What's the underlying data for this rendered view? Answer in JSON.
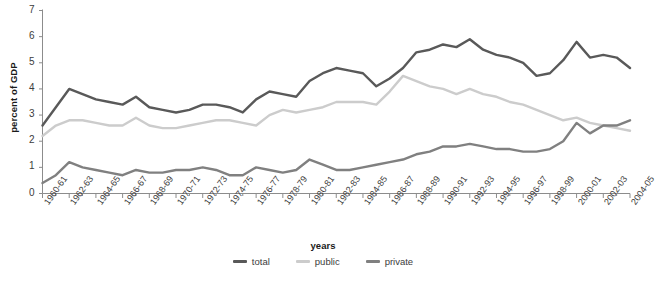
{
  "chart_data": {
    "type": "line",
    "title": "",
    "xlabel": "years",
    "ylabel": "percent of GDP",
    "ylim": [
      0,
      7
    ],
    "yticks": [
      0,
      1,
      2,
      3,
      4,
      5,
      6,
      7
    ],
    "grid": false,
    "legend_position": "bottom-center",
    "categories": [
      "1960-61",
      "1961-62",
      "1962-63",
      "1963-64",
      "1964-65",
      "1965-66",
      "1966-67",
      "1967-68",
      "1968-69",
      "1969-70",
      "1970-71",
      "1971-72",
      "1972-73",
      "1973-74",
      "1974-75",
      "1975-76",
      "1976-77",
      "1977-78",
      "1978-79",
      "1979-80",
      "1980-81",
      "1981-82",
      "1982-83",
      "1983-84",
      "1984-85",
      "1985-86",
      "1986-87",
      "1987-88",
      "1988-89",
      "1989-90",
      "1990-91",
      "1991-92",
      "1992-93",
      "1993-94",
      "1994-95",
      "1995-96",
      "1996-97",
      "1997-98",
      "1998-99",
      "1999-00",
      "2000-01",
      "2001-02",
      "2002-03",
      "2003-04",
      "2004-05"
    ],
    "tick_labels": [
      "1960-61",
      "1962-63",
      "1964-65",
      "1966-67",
      "1968-69",
      "1970-71",
      "1972-73",
      "1974-75",
      "1976-77",
      "1978-79",
      "1980-81",
      "1982-83",
      "1984-85",
      "1986-87",
      "1988-89",
      "1990-91",
      "1992-93",
      "1994-95",
      "1996-97",
      "1998-99",
      "2000-01",
      "2002-03",
      "2004-05"
    ],
    "series": [
      {
        "name": "total",
        "color": "#595959",
        "values": [
          2.6,
          3.3,
          4.0,
          3.8,
          3.6,
          3.5,
          3.4,
          3.7,
          3.3,
          3.2,
          3.1,
          3.2,
          3.4,
          3.4,
          3.3,
          3.1,
          3.6,
          3.9,
          3.8,
          3.7,
          4.3,
          4.6,
          4.8,
          4.7,
          4.6,
          4.1,
          4.4,
          4.8,
          5.4,
          5.5,
          5.7,
          5.6,
          5.9,
          5.5,
          5.3,
          5.2,
          5.0,
          4.5,
          4.6,
          5.1,
          5.8,
          5.2,
          5.3,
          5.2,
          4.8
        ]
      },
      {
        "name": "public",
        "color": "#cccccc",
        "values": [
          2.2,
          2.6,
          2.8,
          2.8,
          2.7,
          2.6,
          2.6,
          2.9,
          2.6,
          2.5,
          2.5,
          2.6,
          2.7,
          2.8,
          2.8,
          2.7,
          2.6,
          3.0,
          3.2,
          3.1,
          3.2,
          3.3,
          3.5,
          3.5,
          3.5,
          3.4,
          3.9,
          4.5,
          4.3,
          4.1,
          4.0,
          3.8,
          4.0,
          3.8,
          3.7,
          3.5,
          3.4,
          3.2,
          3.0,
          2.8,
          2.9,
          2.7,
          2.6,
          2.5,
          2.4
        ]
      },
      {
        "name": "private",
        "color": "#808080",
        "values": [
          0.4,
          0.7,
          1.2,
          1.0,
          0.9,
          0.8,
          0.7,
          0.9,
          0.8,
          0.8,
          0.9,
          0.9,
          1.0,
          0.9,
          0.7,
          0.7,
          1.0,
          0.9,
          0.8,
          0.9,
          1.3,
          1.1,
          0.9,
          0.9,
          1.0,
          1.1,
          1.2,
          1.3,
          1.5,
          1.6,
          1.8,
          1.8,
          1.9,
          1.8,
          1.7,
          1.7,
          1.6,
          1.6,
          1.7,
          2.0,
          2.7,
          2.3,
          2.6,
          2.6,
          2.8
        ]
      }
    ]
  },
  "legend": {
    "items": [
      {
        "label": "total",
        "color": "#595959"
      },
      {
        "label": "public",
        "color": "#cccccc"
      },
      {
        "label": "private",
        "color": "#808080"
      }
    ]
  }
}
